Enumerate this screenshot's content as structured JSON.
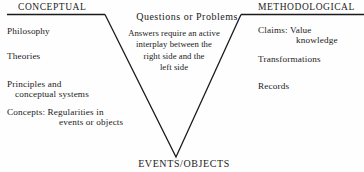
{
  "diagram": {
    "type": "gowin-vee",
    "background_color": "#fefefe",
    "line_color": "#1b1b1b",
    "left_header": "CONCEPTUAL",
    "right_header": "METHODOLOGICAL",
    "bottom_label": "EVENTS/OBJECTS",
    "center": {
      "heading": "Questions or Problems",
      "body_lines": [
        "Answers require an active",
        "interplay between the",
        "right side and the",
        "left side"
      ]
    },
    "left_items": [
      {
        "line1": "Philosophy",
        "line2": ""
      },
      {
        "line1": "Theories",
        "line2": ""
      },
      {
        "line1": "Principles and",
        "line2": "conceptual systems"
      },
      {
        "line1": "Concepts: Regularities in",
        "line2": "events or objects"
      }
    ],
    "right_items": [
      {
        "line1": "Claims: Value",
        "line2": "knowledge"
      },
      {
        "line1": "Transformations",
        "line2": ""
      },
      {
        "line1": "Records",
        "line2": ""
      }
    ]
  }
}
